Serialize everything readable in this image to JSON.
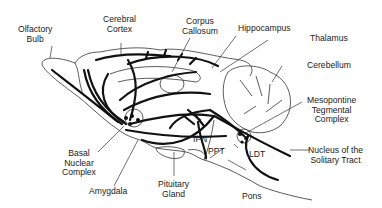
{
  "diagram": {
    "type": "anatomical sagittal brain diagram (cholinergic pathways)",
    "labels": {
      "olfactory_bulb": "Olfactory\nBulb",
      "cerebral_cortex": "Cerebral\nCortex",
      "corpus_callosum": "Corpus\nCallosum",
      "hippocampus": "Hippocampus",
      "thalamus": "Thalamus",
      "cerebellum": "Cerebellum",
      "mesopontine": "Mesopontine\nTegmental\nComplex",
      "nucleus_solitary": "Nucleus of the\nSolitary Tract",
      "basal_nuclear": "Basal\nNuclear\nComplex",
      "amygdala": "Amygdala",
      "pituitary": "Pituitary\nGland",
      "ipn": "IPN",
      "ppt": "PPT",
      "ldt": "LDT",
      "pons": "Pons"
    },
    "colors": {
      "background": "#ffffff",
      "ink": "#111111"
    }
  }
}
